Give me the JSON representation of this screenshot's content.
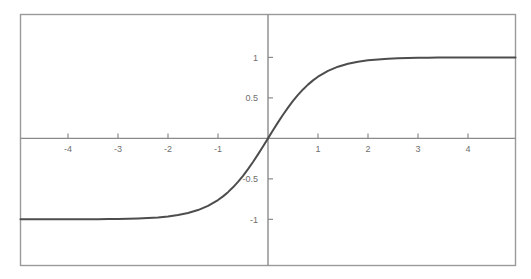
{
  "chart_data": {
    "type": "line",
    "title": "",
    "subtitle": "",
    "xlabel": "",
    "ylabel": "",
    "function": "tanh(x)",
    "xlim": [
      -4.95,
      4.95
    ],
    "ylim": [
      -1.57,
      1.53
    ],
    "grid": false,
    "legend": null,
    "axis_style": "centered-cross",
    "xticks": [
      -4,
      -3,
      -2,
      -1,
      1,
      2,
      3,
      4
    ],
    "xtick_labels": [
      "-4",
      "-3",
      "-2",
      "-1",
      "1",
      "2",
      "3",
      "4"
    ],
    "yticks": [
      -1,
      -0.5,
      0.5,
      1
    ],
    "ytick_labels": [
      "-1",
      "-0.5",
      "0.5",
      "1"
    ],
    "series": [
      {
        "name": "tanh(x)",
        "color": "#4d4d4d",
        "line_width": 2,
        "x": [
          -4.95,
          -4.8,
          -4.6,
          -4.4,
          -4.2,
          -4.0,
          -3.8,
          -3.6,
          -3.4,
          -3.2,
          -3.0,
          -2.8,
          -2.6,
          -2.4,
          -2.2,
          -2.0,
          -1.8,
          -1.6,
          -1.4,
          -1.2,
          -1.0,
          -0.9,
          -0.8,
          -0.7,
          -0.6,
          -0.5,
          -0.4,
          -0.3,
          -0.2,
          -0.1,
          0.0,
          0.1,
          0.2,
          0.3,
          0.4,
          0.5,
          0.6,
          0.7,
          0.8,
          0.9,
          1.0,
          1.2,
          1.4,
          1.6,
          1.8,
          2.0,
          2.2,
          2.4,
          2.6,
          2.8,
          3.0,
          3.2,
          3.4,
          3.6,
          3.8,
          4.0,
          4.2,
          4.4,
          4.6,
          4.8,
          4.95
        ],
        "y": [
          -0.9999,
          -0.9999,
          -0.9998,
          -0.9997,
          -0.9996,
          -0.9993,
          -0.999,
          -0.9985,
          -0.9978,
          -0.9967,
          -0.9951,
          -0.9926,
          -0.989,
          -0.9837,
          -0.9757,
          -0.964,
          -0.9468,
          -0.9217,
          -0.8854,
          -0.8337,
          -0.7616,
          -0.7163,
          -0.664,
          -0.6044,
          -0.537,
          -0.4621,
          -0.3799,
          -0.2913,
          -0.1974,
          -0.0997,
          0.0,
          0.0997,
          0.1974,
          0.2913,
          0.3799,
          0.4621,
          0.537,
          0.6044,
          0.664,
          0.7163,
          0.7616,
          0.8337,
          0.8854,
          0.9217,
          0.9468,
          0.964,
          0.9757,
          0.9837,
          0.989,
          0.9926,
          0.9951,
          0.9967,
          0.9978,
          0.9985,
          0.999,
          0.9993,
          0.9996,
          0.9997,
          0.9998,
          0.9999,
          0.9999
        ]
      }
    ],
    "colors": {
      "curve": "#4d4d4d",
      "axis": "#8a8a8a",
      "frame": "#9a9a9a",
      "tick_text": "#6e6e6e",
      "background": "#ffffff"
    }
  }
}
